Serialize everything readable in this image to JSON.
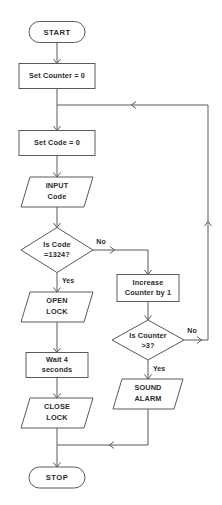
{
  "diagram": {
    "type": "flowchart",
    "background_color": "#ffffff",
    "line_color": "#5a5a5a",
    "text_color": "#2b2b2b",
    "nodes": [
      {
        "id": "start",
        "shape": "terminator",
        "label": "START",
        "lines": [
          "START"
        ],
        "cx": 57,
        "cy": 32,
        "w": 56,
        "h": 21
      },
      {
        "id": "set-counter",
        "shape": "process",
        "label": "Set Counter = 0",
        "lines": [
          "Set Counter = 0"
        ],
        "cx": 57,
        "cy": 76,
        "w": 76,
        "h": 25
      },
      {
        "id": "set-code",
        "shape": "process",
        "label": "Set Code = 0",
        "lines": [
          "Set Code = 0"
        ],
        "cx": 57,
        "cy": 143,
        "w": 76,
        "h": 25
      },
      {
        "id": "input-code",
        "shape": "io",
        "label": "INPUT Code",
        "lines": [
          "INPUT",
          "Code"
        ],
        "cx": 57,
        "cy": 192,
        "w": 72,
        "h": 30
      },
      {
        "id": "is-code",
        "shape": "decision",
        "label": "Is Code =1324?",
        "lines": [
          "Is Code",
          "=1324?"
        ],
        "cx": 57,
        "cy": 250,
        "w": 72,
        "h": 45
      },
      {
        "id": "open-lock",
        "shape": "io",
        "label": "OPEN LOCK",
        "lines": [
          "OPEN",
          "LOCK"
        ],
        "cx": 57,
        "cy": 307,
        "w": 72,
        "h": 30
      },
      {
        "id": "wait",
        "shape": "process",
        "label": "Wait 4 seconds",
        "lines": [
          "Wait 4",
          "seconds"
        ],
        "cx": 57,
        "cy": 365,
        "w": 62,
        "h": 30
      },
      {
        "id": "close-lock",
        "shape": "io",
        "label": "CLOSE LOCK",
        "lines": [
          "CLOSE",
          "LOCK"
        ],
        "cx": 57,
        "cy": 413,
        "w": 72,
        "h": 30
      },
      {
        "id": "stop",
        "shape": "terminator",
        "label": "STOP",
        "lines": [
          "STOP"
        ],
        "cx": 57,
        "cy": 478,
        "w": 56,
        "h": 21
      },
      {
        "id": "increase-counter",
        "shape": "process",
        "label": "Increase Counter by 1",
        "lines": [
          "Increase",
          "Counter by 1"
        ],
        "cx": 148,
        "cy": 288,
        "w": 62,
        "h": 27
      },
      {
        "id": "is-counter",
        "shape": "decision",
        "label": "Is Counter >3?",
        "lines": [
          "Is Counter",
          ">3?"
        ],
        "cx": 148,
        "cy": 340,
        "w": 72,
        "h": 40
      },
      {
        "id": "sound-alarm",
        "shape": "io",
        "label": "SOUND ALARM",
        "lines": [
          "SOUND",
          "ALARM"
        ],
        "cx": 148,
        "cy": 394,
        "w": 70,
        "h": 30
      }
    ],
    "branch_labels": [
      {
        "id": "code-no",
        "text": "No",
        "x": 101,
        "y": 242
      },
      {
        "id": "code-yes",
        "text": "Yes",
        "x": 68,
        "y": 281
      },
      {
        "id": "counter-no",
        "text": "No",
        "x": 192,
        "y": 331
      },
      {
        "id": "counter-yes",
        "text": "Yes",
        "x": 159,
        "y": 369
      }
    ],
    "edges": [
      {
        "id": "start-to-setcounter",
        "from": "start",
        "to": "set-counter",
        "path": "M57,42.5 L57,63.5",
        "arrow": "down",
        "arrow_x": 57,
        "arrow_y": 63.5
      },
      {
        "id": "setcounter-to-setcode",
        "from": "set-counter",
        "to": "set-code",
        "path": "M57,88.5 L57,130.5",
        "arrow": "down",
        "arrow_x": 57,
        "arrow_y": 130.5
      },
      {
        "id": "setcode-to-input",
        "from": "set-code",
        "to": "input-code",
        "path": "M57,155.5 L57,177",
        "arrow": "down",
        "arrow_x": 57,
        "arrow_y": 177
      },
      {
        "id": "input-to-iscode",
        "from": "input-code",
        "to": "is-code",
        "path": "M57,207 L57,227.5",
        "arrow": "down",
        "arrow_x": 57,
        "arrow_y": 227.5
      },
      {
        "id": "iscode-yes-openlock",
        "from": "is-code",
        "to": "open-lock",
        "path": "M57,272.5 L57,292",
        "arrow": "down",
        "arrow_x": 57,
        "arrow_y": 292
      },
      {
        "id": "openlock-to-wait",
        "from": "open-lock",
        "to": "wait",
        "path": "M57,322 L57,352.5",
        "arrow": "down",
        "arrow_x": 57,
        "arrow_y": 352.5
      },
      {
        "id": "wait-to-closelock",
        "from": "wait",
        "to": "close-lock",
        "path": "M57,377.5 L57,398",
        "arrow": "down",
        "arrow_x": 57,
        "arrow_y": 398
      },
      {
        "id": "closelock-to-stop",
        "from": "close-lock",
        "to": "stop",
        "path": "M57,428 L57,467",
        "arrow": "down",
        "arrow_x": 57,
        "arrow_y": 467
      },
      {
        "id": "iscode-no-increase",
        "from": "is-code",
        "to": "increase-counter",
        "path": "M93,250 L148,250 L148,274.5",
        "arrow": "down",
        "arrow_x": 148,
        "arrow_y": 274.5,
        "mid_arrow_x": 114,
        "mid_arrow_y": 250,
        "mid_arrow_dir": "right"
      },
      {
        "id": "increase-to-iscounter",
        "from": "increase-counter",
        "to": "is-counter",
        "path": "M148,301.5 L148,320",
        "arrow": "down",
        "arrow_x": 148,
        "arrow_y": 320
      },
      {
        "id": "iscounter-yes-alarm",
        "from": "is-counter",
        "to": "sound-alarm",
        "path": "M148,360 L148,379",
        "arrow": "down",
        "arrow_x": 148,
        "arrow_y": 379
      },
      {
        "id": "alarm-to-stoptrunk",
        "from": "sound-alarm",
        "to": "stop",
        "path": "M148,409 L148,445 L57,445",
        "arrow": "left",
        "arrow_x": 110,
        "arrow_y": 445
      },
      {
        "id": "iscounter-no-loop",
        "from": "is-counter",
        "to": "set-code",
        "path": "M184,340 L208,340 L208,105 L57,105",
        "arrow": "left",
        "arrow_x": 132,
        "arrow_y": 105,
        "mid_arrow_x": 208,
        "mid_arrow_y": 222,
        "mid_arrow_dir": "up",
        "entry_arrow_x": 201,
        "entry_arrow_y": 340
      }
    ]
  }
}
